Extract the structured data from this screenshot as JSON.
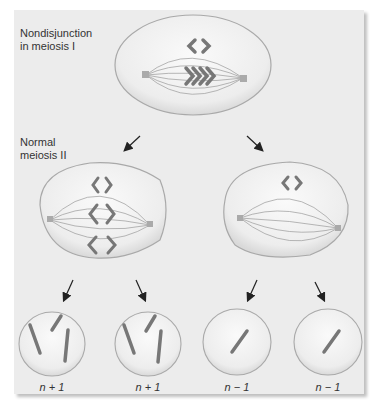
{
  "labels": {
    "top_line1": "Nondisjunction",
    "top_line2": "in meiosis I",
    "mid_line1": "Normal",
    "mid_line2": "meiosis II"
  },
  "daughter_cells": [
    {
      "label": "n + 1",
      "chromosomes": 3
    },
    {
      "label": "n + 1",
      "chromosomes": 3
    },
    {
      "label": "n − 1",
      "chromosomes": 1
    },
    {
      "label": "n − 1",
      "chromosomes": 1
    }
  ],
  "colors": {
    "background": "#ececec",
    "cell_fill": "#f4f4f4",
    "cell_edge": "#a9a9a9",
    "chromosome": "#7a7a7a",
    "spindle": "#9a9a9a",
    "arrow": "#222222"
  }
}
